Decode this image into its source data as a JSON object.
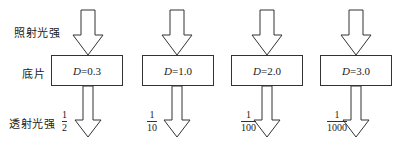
{
  "labels": {
    "incident": "照射光强",
    "film": "底片",
    "transmitted": "透射光强"
  },
  "films": [
    {
      "var": "D",
      "eq": "=0.3",
      "num": "1",
      "den": "2"
    },
    {
      "var": "D",
      "eq": "=1.0",
      "num": "1",
      "den": "10"
    },
    {
      "var": "D",
      "eq": "=2.0",
      "num": "1",
      "den": "100"
    },
    {
      "var": "D",
      "eq": "=3.0",
      "num": "1",
      "den": "1000"
    }
  ],
  "colors": {
    "stroke": "#333333",
    "background": "#ffffff"
  }
}
